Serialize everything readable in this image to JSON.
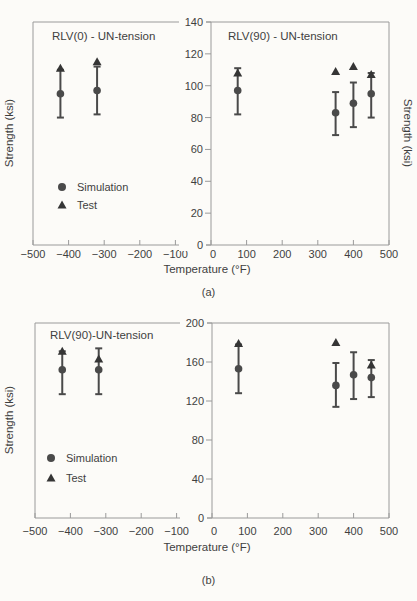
{
  "colors": {
    "marker": "#4a4a4a",
    "triangle": "#353535",
    "errorbar": "#4a4a4a",
    "axis": "#9a9a9a",
    "text": "#3f3f3f",
    "background": "#fcfbf8"
  },
  "chart_data": [
    {
      "id": "a",
      "type": "scatter",
      "caption": "(a)",
      "xlabel": "Temperature (°F)",
      "ylabel_left": "Strength (ksi)",
      "ylabel_right": "Strength (ksi)",
      "xlim": [
        -500,
        500
      ],
      "ylim": [
        0,
        140
      ],
      "xticks": [
        -500,
        -400,
        -300,
        -200,
        -100,
        0,
        100,
        200,
        300,
        400,
        500
      ],
      "yticks": [
        0,
        20,
        40,
        60,
        80,
        100,
        120,
        140
      ],
      "titles": [
        "RLV(0) - UN-tension",
        "RLV(90) - UN-tension"
      ],
      "legend": [
        {
          "marker": "circle",
          "label": "Simulation"
        },
        {
          "marker": "triangle",
          "label": "Test"
        }
      ],
      "series": [
        {
          "name": "Simulation",
          "marker": "circle",
          "points": [
            {
              "x": -423,
              "y": 95,
              "lo": 80,
              "hi": 110
            },
            {
              "x": -320,
              "y": 97,
              "lo": 82,
              "hi": 112
            },
            {
              "x": 75,
              "y": 97,
              "lo": 82,
              "hi": 111
            },
            {
              "x": 350,
              "y": 83,
              "lo": 69,
              "hi": 96
            },
            {
              "x": 400,
              "y": 89,
              "lo": 74,
              "hi": 102
            },
            {
              "x": 450,
              "y": 95,
              "lo": 80,
              "hi": 108
            }
          ]
        },
        {
          "name": "Test",
          "marker": "triangle",
          "points": [
            {
              "x": -423,
              "y": 111
            },
            {
              "x": -320,
              "y": 115
            },
            {
              "x": 75,
              "y": 108
            },
            {
              "x": 350,
              "y": 109
            },
            {
              "x": 400,
              "y": 112
            },
            {
              "x": 450,
              "y": 107
            }
          ]
        }
      ]
    },
    {
      "id": "b",
      "type": "scatter",
      "caption": "(b)",
      "xlabel": "Temperature (°F)",
      "ylabel_left": "Strength (ksi)",
      "ylabel_right": null,
      "xlim": [
        -500,
        500
      ],
      "ylim": [
        0,
        200
      ],
      "xticks": [
        -500,
        -400,
        -300,
        -200,
        -100,
        0,
        100,
        200,
        300,
        400,
        500
      ],
      "yticks": [
        0,
        40,
        80,
        120,
        160,
        200
      ],
      "titles": [
        "RLV(90)-UN-tension"
      ],
      "legend": [
        {
          "marker": "circle",
          "label": "Simulation"
        },
        {
          "marker": "triangle",
          "label": "Test"
        }
      ],
      "series": [
        {
          "name": "Simulation",
          "marker": "circle",
          "points": [
            {
              "x": -423,
              "y": 152,
              "lo": 127,
              "hi": 171
            },
            {
              "x": -320,
              "y": 152,
              "lo": 127,
              "hi": 174
            },
            {
              "x": 75,
              "y": 153,
              "lo": 128,
              "hi": 178
            },
            {
              "x": 350,
              "y": 136,
              "lo": 114,
              "hi": 159
            },
            {
              "x": 400,
              "y": 147,
              "lo": 122,
              "hi": 170
            },
            {
              "x": 450,
              "y": 144,
              "lo": 124,
              "hi": 162
            }
          ]
        },
        {
          "name": "Test",
          "marker": "triangle",
          "points": [
            {
              "x": -423,
              "y": 171
            },
            {
              "x": -320,
              "y": 163
            },
            {
              "x": 75,
              "y": 179
            },
            {
              "x": 350,
              "y": 180
            },
            {
              "x": 450,
              "y": 157
            }
          ]
        }
      ]
    }
  ]
}
